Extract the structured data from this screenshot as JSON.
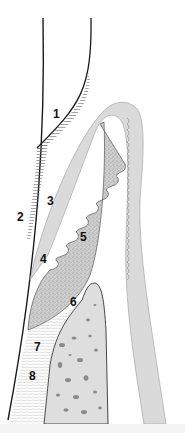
{
  "diagram": {
    "type": "anatomical cross-section",
    "colors": {
      "background": "#ffffff",
      "outline": "#1a1a1a",
      "epithelium": "#d9d9d9",
      "connective_tissue": "#c8c8c8",
      "bone": "#dcdcdc",
      "bone_pores": "#8a8a8a",
      "hatch": "#555555"
    },
    "labels": [
      {
        "id": "1",
        "text": "1",
        "x": 53,
        "y": 118
      },
      {
        "id": "2",
        "text": "2",
        "x": 17,
        "y": 221
      },
      {
        "id": "3",
        "text": "3",
        "x": 47,
        "y": 205
      },
      {
        "id": "4",
        "text": "4",
        "x": 40,
        "y": 263
      },
      {
        "id": "5",
        "text": "5",
        "x": 80,
        "y": 241
      },
      {
        "id": "6",
        "text": "6",
        "x": 70,
        "y": 306
      },
      {
        "id": "7",
        "text": "7",
        "x": 34,
        "y": 351
      },
      {
        "id": "8",
        "text": "8",
        "x": 29,
        "y": 380
      }
    ]
  }
}
